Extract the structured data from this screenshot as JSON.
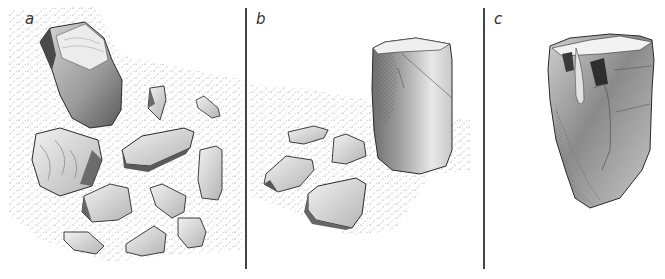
{
  "figure": {
    "panels": [
      {
        "label": "a",
        "label_x": 25,
        "label_y": 12,
        "description": "large core with scattered flakes on stippled ground"
      },
      {
        "label": "b",
        "label_x": 256,
        "label_y": 12,
        "description": "cylindrical core standing beside four flakes"
      },
      {
        "label": "c",
        "label_x": 494,
        "label_y": 12,
        "description": "refitted core with flakes reassembled"
      }
    ],
    "dividers": [
      {
        "x": 245,
        "top": 8,
        "bottom": 269
      },
      {
        "x": 483,
        "top": 8,
        "bottom": 269
      }
    ],
    "colors": {
      "ink": "#2a2a2a",
      "stipple": "#555555",
      "shade_dark": "#6a6a6a",
      "shade_mid": "#a8a8a8",
      "shade_light": "#e4e4e4",
      "background": "#ffffff"
    }
  }
}
